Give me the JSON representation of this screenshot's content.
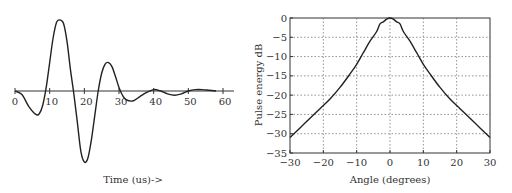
{
  "chart_data": [
    {
      "type": "line",
      "title": "",
      "xlabel": "Time (us)->",
      "ylabel": "",
      "xlim": [
        0,
        63
      ],
      "x_ticks": [
        0,
        10,
        20,
        30,
        40,
        50,
        60
      ],
      "grid": false,
      "series": [
        {
          "name": "pulse",
          "x": [
            0,
            2,
            4,
            6,
            7,
            8,
            9,
            10,
            11,
            12,
            13,
            14,
            15,
            16,
            17,
            18,
            19,
            20,
            21,
            22,
            23,
            24,
            25,
            26,
            27,
            28,
            29,
            30,
            31,
            32,
            34,
            36,
            38,
            40,
            42,
            44,
            46,
            48,
            50,
            52,
            54,
            56,
            58
          ],
          "y": [
            0,
            -0.05,
            -0.22,
            -0.33,
            -0.32,
            -0.2,
            0.05,
            0.4,
            0.75,
            0.97,
            1.0,
            0.95,
            0.7,
            0.3,
            -0.05,
            -0.45,
            -0.85,
            -1.0,
            -0.95,
            -0.7,
            -0.35,
            0.0,
            0.25,
            0.38,
            0.4,
            0.34,
            0.2,
            0.05,
            -0.06,
            -0.12,
            -0.14,
            -0.08,
            -0.02,
            0.02,
            0.0,
            -0.04,
            -0.06,
            -0.04,
            0.0,
            0.02,
            0.02,
            0.01,
            0.0
          ]
        }
      ]
    },
    {
      "type": "line",
      "title": "",
      "xlabel": "Angle (degrees)",
      "ylabel": "Pulse energy dB",
      "xlim": [
        -30,
        30
      ],
      "ylim": [
        -35,
        0
      ],
      "x_ticks": [
        -30,
        -20,
        -10,
        0,
        10,
        20,
        30
      ],
      "y_ticks": [
        0,
        -5,
        -10,
        -15,
        -20,
        -25,
        -30,
        -35
      ],
      "grid": true,
      "series": [
        {
          "name": "pulse energy",
          "x": [
            -30,
            -27,
            -24,
            -21,
            -18,
            -15,
            -12,
            -10,
            -8,
            -6,
            -4,
            -3,
            -2,
            -1,
            0,
            1,
            2,
            3,
            4,
            6,
            8,
            10,
            12,
            15,
            18,
            21,
            24,
            27,
            30
          ],
          "y": [
            -31,
            -28.5,
            -26,
            -23.5,
            -21,
            -18,
            -14.5,
            -12,
            -9,
            -6,
            -3.5,
            -1.5,
            -1,
            -0.3,
            0,
            -0.3,
            -1,
            -1.5,
            -3.5,
            -6,
            -9,
            -12,
            -14.5,
            -18,
            -21,
            -23.5,
            -26,
            -28.5,
            -31
          ]
        }
      ]
    }
  ],
  "left_chart": {
    "xlabel": "Time (us)->",
    "ticks": [
      "0",
      "10",
      "20",
      "30",
      "40",
      "50",
      "60"
    ]
  },
  "right_chart": {
    "xlabel": "Angle (degrees)",
    "ylabel": "Pulse energy dB",
    "xticks": [
      "−30",
      "−20",
      "−10",
      "0",
      "10",
      "20",
      "30"
    ],
    "yticks": [
      "0",
      "−5",
      "−10",
      "−15",
      "−20",
      "−25",
      "−30",
      "−35"
    ]
  }
}
